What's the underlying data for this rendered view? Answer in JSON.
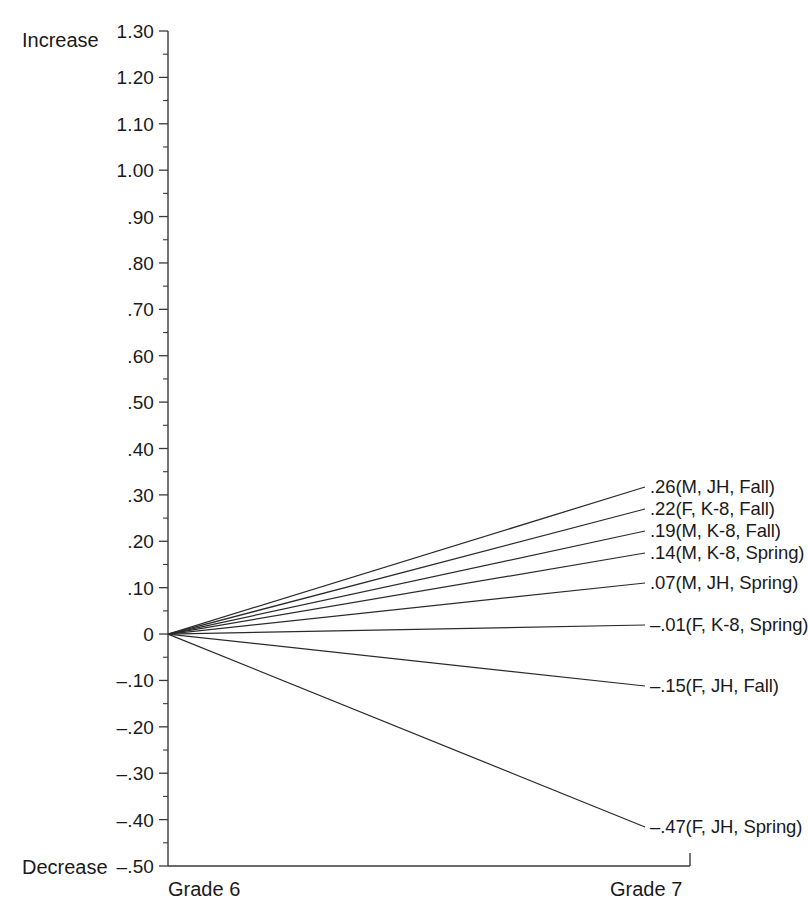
{
  "chart_data": {
    "type": "line",
    "title": "",
    "subtitle": "",
    "xlabel": "",
    "ylabel": "",
    "categories": [
      "Grade 6",
      "Grade 7"
    ],
    "x_tick_labels": [
      "Grade 6",
      "Grade 7"
    ],
    "ylim": [
      -0.5,
      1.3
    ],
    "y_tick_labels": [
      "1.30",
      "1.20",
      "1.10",
      "1.00",
      ".90",
      ".80",
      ".70",
      ".60",
      ".50",
      ".40",
      ".30",
      ".20",
      ".10",
      "0",
      "–.10",
      "–.20",
      "–.30",
      "–.40",
      "–.50"
    ],
    "y_tick_values": [
      1.3,
      1.2,
      1.1,
      1.0,
      0.9,
      0.8,
      0.7,
      0.6,
      0.5,
      0.4,
      0.3,
      0.2,
      0.1,
      0,
      -0.1,
      -0.2,
      -0.3,
      -0.4,
      -0.5
    ],
    "y_minor_step": 0.05,
    "grid": false,
    "legend_position": "right-inline",
    "axis_top_label": "Increase",
    "axis_bottom_label": "Decrease",
    "series": [
      {
        "name": ".26(M, JH, Fall)",
        "label": ".26(M, JH, Fall)",
        "values": [
          0,
          0.26
        ],
        "end_value": 0.26,
        "sex": "M",
        "school": "JH",
        "term": "Fall"
      },
      {
        "name": ".22(F, K-8, Fall)",
        "label": ".22(F, K-8, Fall)",
        "values": [
          0,
          0.22
        ],
        "end_value": 0.22,
        "sex": "F",
        "school": "K-8",
        "term": "Fall"
      },
      {
        "name": ".19(M, K-8, Fall)",
        "label": ".19(M, K-8, Fall)",
        "values": [
          0,
          0.19
        ],
        "end_value": 0.19,
        "sex": "M",
        "school": "K-8",
        "term": "Fall"
      },
      {
        "name": ".14(M, K-8, Spring)",
        "label": ".14(M, K-8, Spring)",
        "values": [
          0,
          0.14
        ],
        "end_value": 0.14,
        "sex": "M",
        "school": "K-8",
        "term": "Spring"
      },
      {
        "name": ".07(M, JH, Spring)",
        "label": ".07(M, JH, Spring)",
        "values": [
          0,
          0.07
        ],
        "end_value": 0.07,
        "sex": "M",
        "school": "JH",
        "term": "Spring"
      },
      {
        "name": "-.01(F, K-8, Spring)",
        "label": "–.01(F, K-8, Spring)",
        "values": [
          0,
          -0.01
        ],
        "end_value": -0.01,
        "sex": "F",
        "school": "K-8",
        "term": "Spring"
      },
      {
        "name": "-.15(F, JH, Fall)",
        "label": "–.15(F, JH, Fall)",
        "values": [
          0,
          -0.15
        ],
        "end_value": -0.15,
        "sex": "F",
        "school": "JH",
        "term": "Fall"
      },
      {
        "name": "-.47(F, JH, Spring)",
        "label": "–.47(F, JH, Spring)",
        "values": [
          0,
          -0.47
        ],
        "end_value": -0.47,
        "sex": "F",
        "school": "JH",
        "term": "Spring"
      }
    ],
    "colors": {
      "line": "#2b2b2b",
      "axis": "#3a3a3a",
      "text": "#1a1a1a",
      "background": "#ffffff"
    }
  }
}
